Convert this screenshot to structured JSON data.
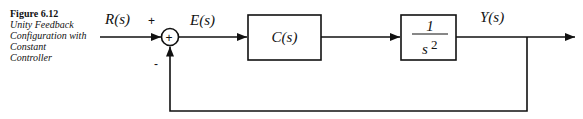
{
  "caption": {
    "figure_label": "Figure 6.12",
    "description": "Unity Feedback Configuration with Constant Controller"
  },
  "signals": {
    "input": "R(s)",
    "error": "E(s)",
    "output": "Y(s)"
  },
  "summing_junction": {
    "symbol": "+",
    "input_sign": "+",
    "feedback_sign": "-"
  },
  "blocks": {
    "controller": {
      "label": "C(s)"
    },
    "plant": {
      "numerator": "1",
      "denominator": "s",
      "exponent": "2"
    }
  },
  "colors": {
    "line": "#111111",
    "background": "#ffffff"
  }
}
